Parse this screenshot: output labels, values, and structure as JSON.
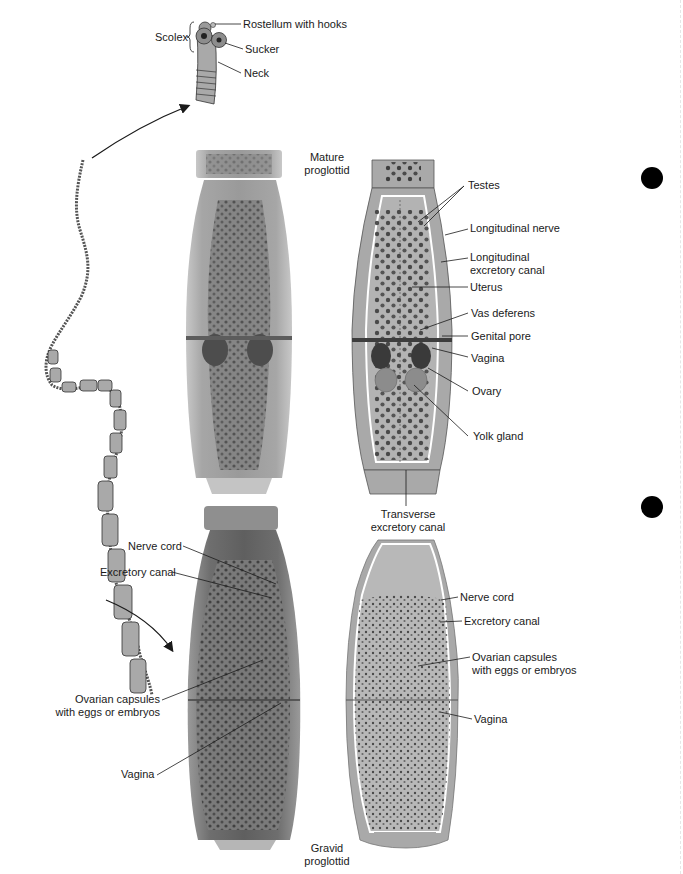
{
  "figure": {
    "colors": {
      "background": "#ffffff",
      "tissue_fill": "#a9a9a9",
      "tissue_light": "#bdbdbd",
      "photo_gray": "#8c8c8c",
      "egg_dark": "#3a3a3a",
      "canal_white": "#ffffff",
      "leader_line": "#1a1a1a",
      "binder_hole": "#000000"
    }
  },
  "scolex": {
    "group_label": "Scolex",
    "labels": {
      "rostellum": "Rostellum with hooks",
      "sucker": "Sucker",
      "neck": "Neck"
    }
  },
  "mature_proglottid": {
    "title_line1": "Mature",
    "title_line2": "proglottid",
    "labels": {
      "testes": "Testes",
      "longitudinal_nerve": "Longitudinal nerve",
      "long_canal_line1": "Longitudinal",
      "long_canal_line2": "excretory canal",
      "uterus": "Uterus",
      "vas_deferens": "Vas deferens",
      "genital_pore": "Genital pore",
      "vagina": "Vagina",
      "ovary": "Ovary",
      "yolk_gland": "Yolk gland",
      "transverse_line1": "Transverse",
      "transverse_line2": "excretory canal"
    }
  },
  "gravid_proglottid": {
    "title_line1": "Gravid",
    "title_line2": "proglottid",
    "photo_labels": {
      "nerve_cord": "Nerve cord",
      "excretory_canal": "Excretory canal",
      "ovarian_line1": "Ovarian capsules",
      "ovarian_line2": "with eggs or embryos",
      "vagina": "Vagina"
    },
    "drawing_labels": {
      "nerve_cord": "Nerve cord",
      "excretory_canal": "Excretory canal",
      "ovarian_line1": "Ovarian capsules",
      "ovarian_line2": "with eggs or embryos",
      "vagina": "Vagina"
    }
  }
}
